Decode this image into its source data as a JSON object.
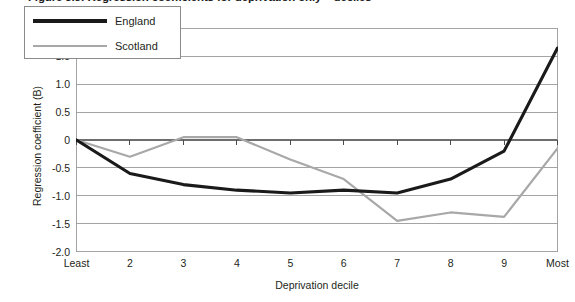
{
  "figure": {
    "title": "Figure 3.3: Regression coefficients for deprivation only – deciles"
  },
  "legend": {
    "position": "top-left-inside",
    "entries": [
      {
        "label": "England",
        "color": "#1a1a1a",
        "width": 3.2
      },
      {
        "label": "Scotland",
        "color": "#a8a8a8",
        "width": 2.2
      }
    ]
  },
  "axes": {
    "y": {
      "title": "Regression coefficient (B)",
      "min": -2.0,
      "max": 2.0,
      "ticks": [
        "2.0",
        "1.5",
        "1.0",
        "0.5",
        "0",
        "-0.5",
        "-1.0",
        "-1.5",
        "-2.0"
      ],
      "tick_values": [
        2.0,
        1.5,
        1.0,
        0.5,
        0,
        -0.5,
        -1.0,
        -1.5,
        -2.0
      ]
    },
    "x": {
      "title": "Deprivation decile",
      "ticks": [
        "Least",
        "2",
        "3",
        "4",
        "5",
        "6",
        "7",
        "8",
        "9",
        "Most"
      ]
    }
  },
  "chart_data": {
    "type": "line",
    "title": "Figure 3.3: Regression coefficients for deprivation only – deciles",
    "xlabel": "Deprivation decile",
    "ylabel": "Regression coefficient (B)",
    "categories": [
      "Least",
      "2",
      "3",
      "4",
      "5",
      "6",
      "7",
      "8",
      "9",
      "Most"
    ],
    "ylim": [
      -2.0,
      2.0
    ],
    "yticks": [
      -2.0,
      -1.5,
      -1.0,
      -0.5,
      0,
      0.5,
      1.0,
      1.5,
      2.0
    ],
    "grid": "horizontal",
    "legend_position": "upper left",
    "series": [
      {
        "name": "England",
        "color": "#1a1a1a",
        "values": [
          0.0,
          -0.6,
          -0.8,
          -0.9,
          -0.95,
          -0.9,
          -0.95,
          -0.7,
          -0.2,
          1.65
        ]
      },
      {
        "name": "Scotland",
        "color": "#a8a8a8",
        "values": [
          0.0,
          -0.3,
          0.05,
          0.05,
          -0.35,
          -0.7,
          -1.45,
          -1.3,
          -1.38,
          -0.15
        ]
      }
    ]
  }
}
